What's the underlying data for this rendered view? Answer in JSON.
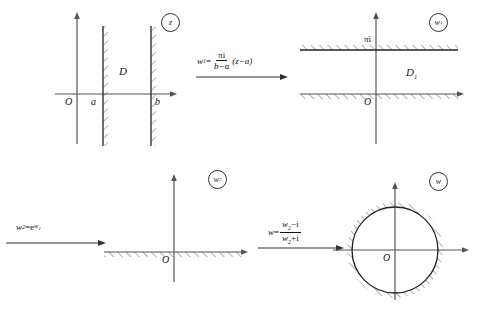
{
  "figure": {
    "background": "#ffffff",
    "stroke": "#333333"
  },
  "panels": [
    {
      "id": "z-plane",
      "plane_label": "z",
      "region_label": "D",
      "origin_label": "O",
      "axis_marks": [
        "a",
        "b"
      ],
      "description": "vertical strip between x=a and x=b, hatched on outside of both boundary lines"
    },
    {
      "id": "w1-plane",
      "plane_label": "w",
      "plane_label_sub": "1",
      "region_label": "D",
      "region_label_sub": "1",
      "origin_label": "O",
      "top_boundary_label": "πi",
      "description": "horizontal strip between Im w = 0 and Im w = pi, hatched above top line and below bottom line"
    },
    {
      "id": "w2-plane",
      "plane_label": "w",
      "plane_label_sub": "2",
      "origin_label": "O",
      "description": "upper half plane, real axis hatched below"
    },
    {
      "id": "w-plane",
      "plane_label": "w",
      "origin_label": "O",
      "description": "unit disk, circle hatched on the outside"
    }
  ],
  "maps": [
    {
      "id": "map-1",
      "lhs": "w",
      "lhs_sub": "1",
      "eq": "=",
      "numerator": "πi",
      "denominator": "b−a",
      "trailing": "(z−a)",
      "arrow": "right-arrow"
    },
    {
      "id": "map-2",
      "lhs": "w",
      "lhs_sub": "2",
      "eq": "=",
      "base": "e",
      "exponent": "w",
      "exponent_sub": "1",
      "arrow": "right-arrow"
    },
    {
      "id": "map-3",
      "lhs": "w",
      "eq": "=",
      "numerator": "w",
      "numerator_sub": "2",
      "numerator_rest": "−i",
      "denominator": "w",
      "denominator_sub": "2",
      "denominator_rest": "+i",
      "arrow": "right-arrow"
    }
  ]
}
